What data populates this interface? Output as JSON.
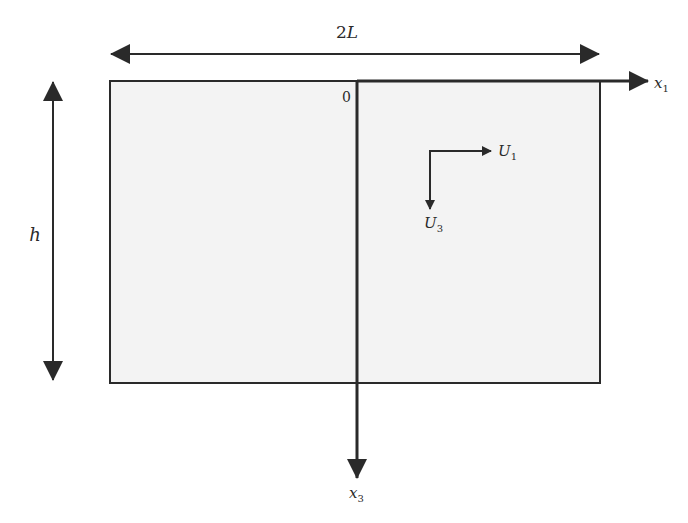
{
  "figure": {
    "dimension_width_label": "2L",
    "dimension_height_label": "h",
    "origin_label": "0",
    "axis_x1": {
      "base": "x",
      "sub": "1"
    },
    "axis_x3": {
      "base": "x",
      "sub": "3"
    },
    "velocity_u1": {
      "base": "U",
      "sub": "1"
    },
    "velocity_u3": {
      "base": "U",
      "sub": "3"
    }
  },
  "colors": {
    "stroke": "#2a2a2a",
    "rect_fill": "#f3f3f3",
    "background": "#ffffff"
  }
}
